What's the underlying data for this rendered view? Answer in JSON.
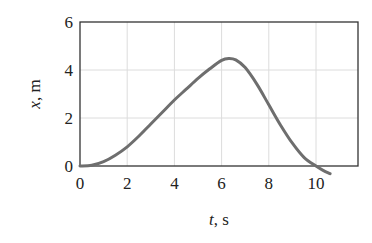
{
  "chart_data": {
    "type": "line",
    "title": "",
    "xlabel_var": "t",
    "xlabel_unit": ", s",
    "ylabel_var": "x",
    "ylabel_unit": ", m",
    "xlim": [
      0,
      11.8
    ],
    "ylim": [
      0,
      6
    ],
    "x_ticks": [
      0,
      2,
      4,
      6,
      8,
      10
    ],
    "y_ticks": [
      0,
      2,
      4,
      6
    ],
    "grid": true,
    "series": [
      {
        "name": "x(t)",
        "color": "#6e6e6e",
        "x": [
          0,
          0.5,
          1,
          1.5,
          2,
          2.5,
          3,
          3.5,
          4,
          4.5,
          5,
          5.5,
          6,
          6.3,
          6.6,
          7,
          7.5,
          8,
          8.5,
          9,
          9.5,
          10,
          10.3,
          10.6
        ],
        "y": [
          0,
          0.03,
          0.18,
          0.45,
          0.8,
          1.25,
          1.75,
          2.25,
          2.75,
          3.2,
          3.65,
          4.05,
          4.4,
          4.48,
          4.42,
          4.1,
          3.4,
          2.55,
          1.7,
          0.95,
          0.35,
          0.0,
          -0.18,
          -0.32
        ]
      }
    ]
  }
}
